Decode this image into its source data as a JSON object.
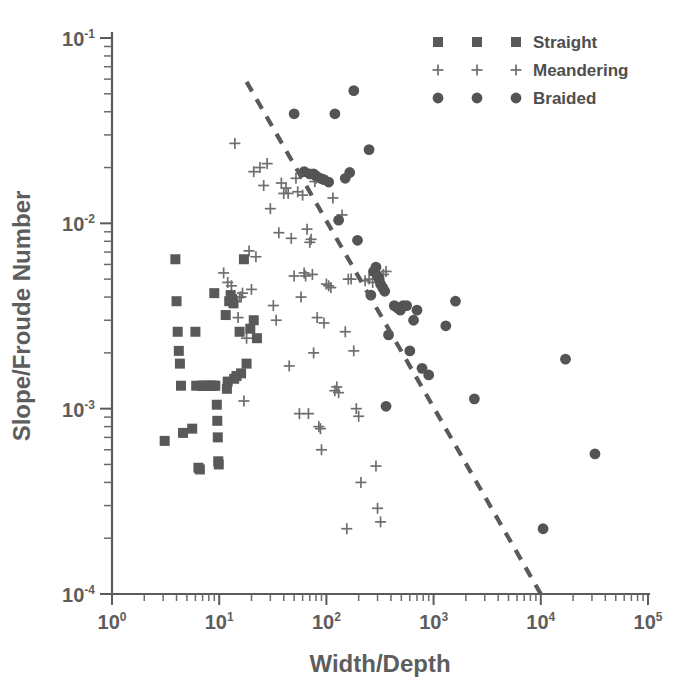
{
  "chart_data": {
    "type": "scatter",
    "title": "",
    "xlabel": "Width/Depth",
    "ylabel": "Slope/Froude Number",
    "xscale": "log",
    "yscale": "log",
    "xlim": [
      1,
      100000
    ],
    "ylim": [
      0.0001,
      0.1
    ],
    "grid": false,
    "legend_position": "top-right",
    "xtick_labels": [
      "10",
      "10",
      "10",
      "10",
      "10",
      "10"
    ],
    "xtick_exponents": [
      "0",
      "1",
      "2",
      "3",
      "4",
      "5"
    ],
    "ytick_labels": [
      "10",
      "10",
      "10",
      "10"
    ],
    "ytick_exponents": [
      "-1",
      "-2",
      "-3",
      "-4"
    ],
    "series": [
      {
        "name": "Straight",
        "marker": "square",
        "color": "#595959",
        "points": [
          [
            3.1,
            0.00067
          ],
          [
            3.9,
            0.0064
          ],
          [
            4.0,
            0.0038
          ],
          [
            4.1,
            0.0026
          ],
          [
            4.2,
            0.00205
          ],
          [
            4.3,
            0.00175
          ],
          [
            4.4,
            0.00133
          ],
          [
            4.6,
            0.00074
          ],
          [
            5.6,
            0.00078
          ],
          [
            6.0,
            0.0026
          ],
          [
            6.1,
            0.00133
          ],
          [
            6.4,
            0.00048
          ],
          [
            6.6,
            0.00047
          ],
          [
            6.9,
            0.00133
          ],
          [
            7.2,
            0.00133
          ],
          [
            7.6,
            0.00133
          ],
          [
            8.0,
            0.00133
          ],
          [
            8.4,
            0.00133
          ],
          [
            8.8,
            0.00133
          ],
          [
            9.2,
            0.00133
          ],
          [
            9.0,
            0.0042
          ],
          [
            9.5,
            0.00105
          ],
          [
            9.6,
            0.00086
          ],
          [
            9.7,
            0.0007
          ],
          [
            9.8,
            0.00052
          ],
          [
            9.9,
            0.0005
          ],
          [
            11.5,
            0.0032
          ],
          [
            11.8,
            0.00128
          ],
          [
            12.0,
            0.0014
          ],
          [
            12.4,
            0.0038
          ],
          [
            12.8,
            0.0041
          ],
          [
            13.2,
            0.0039
          ],
          [
            13.6,
            0.0037
          ],
          [
            13.8,
            0.00145
          ],
          [
            14.5,
            0.0015
          ],
          [
            15.5,
            0.0026
          ],
          [
            16.0,
            0.00155
          ],
          [
            17.0,
            0.0064
          ],
          [
            18.0,
            0.00175
          ],
          [
            19.5,
            0.0027
          ],
          [
            21.0,
            0.003
          ],
          [
            22.5,
            0.0024
          ]
        ]
      },
      {
        "name": "Meandering",
        "marker": "cross",
        "color": "#6e6e6e",
        "points": [
          [
            11.0,
            0.0054
          ],
          [
            12.0,
            0.0048
          ],
          [
            13.0,
            0.0046
          ],
          [
            14.0,
            0.027
          ],
          [
            14.5,
            0.0038
          ],
          [
            15.0,
            0.0031
          ],
          [
            15.5,
            0.004
          ],
          [
            16.0,
            0.004
          ],
          [
            16.5,
            0.0042
          ],
          [
            17.0,
            0.0011
          ],
          [
            18.0,
            0.0024
          ],
          [
            19.0,
            0.0071
          ],
          [
            20.0,
            0.0044
          ],
          [
            21.0,
            0.019
          ],
          [
            22.0,
            0.0066
          ],
          [
            24.0,
            0.02
          ],
          [
            26.0,
            0.016
          ],
          [
            28.0,
            0.021
          ],
          [
            30.0,
            0.012
          ],
          [
            32.0,
            0.0036
          ],
          [
            34.0,
            0.003
          ],
          [
            36.0,
            0.0089
          ],
          [
            38.0,
            0.0165
          ],
          [
            40.0,
            0.0145
          ],
          [
            42.0,
            0.0155
          ],
          [
            44.0,
            0.0145
          ],
          [
            45.0,
            0.0017
          ],
          [
            47.0,
            0.0083
          ],
          [
            50.0,
            0.0052
          ],
          [
            52.0,
            0.0175
          ],
          [
            54.0,
            0.0148
          ],
          [
            56.0,
            0.00094
          ],
          [
            58.0,
            0.004
          ],
          [
            60.0,
            0.0142
          ],
          [
            62.0,
            0.0054
          ],
          [
            64.0,
            0.0052
          ],
          [
            66.0,
            0.0093
          ],
          [
            68.0,
            0.00094
          ],
          [
            70.0,
            0.0079
          ],
          [
            72.0,
            0.0082
          ],
          [
            74.0,
            0.0053
          ],
          [
            76.0,
            0.002
          ],
          [
            78.0,
            0.0168
          ],
          [
            80.0,
            0.0175
          ],
          [
            82.0,
            0.0031
          ],
          [
            85.0,
            0.0008
          ],
          [
            88.0,
            0.00078
          ],
          [
            90.0,
            0.0006
          ],
          [
            95.0,
            0.0029
          ],
          [
            100.0,
            0.0047
          ],
          [
            105.0,
            0.0046
          ],
          [
            110.0,
            0.0045
          ],
          [
            115.0,
            0.0137
          ],
          [
            120.0,
            0.00125
          ],
          [
            125.0,
            0.00131
          ],
          [
            130.0,
            0.00122
          ],
          [
            140.0,
            0.0111
          ],
          [
            150.0,
            0.0026
          ],
          [
            155.0,
            0.000225
          ],
          [
            160.0,
            0.005
          ],
          [
            170.0,
            0.005
          ],
          [
            180.0,
            0.00205
          ],
          [
            190.0,
            0.001
          ],
          [
            200.0,
            0.00091
          ],
          [
            210.0,
            0.0004
          ],
          [
            230.0,
            0.0049
          ],
          [
            250.0,
            0.005
          ],
          [
            270.0,
            0.0048
          ],
          [
            290.0,
            0.00049
          ],
          [
            300.0,
            0.00029
          ],
          [
            320.0,
            0.000245
          ],
          [
            340.0,
            0.0053
          ],
          [
            360.0,
            0.0055
          ]
        ]
      },
      {
        "name": "Braided",
        "marker": "circle",
        "color": "#545454",
        "points": [
          [
            50.0,
            0.039
          ],
          [
            62.0,
            0.019
          ],
          [
            70.0,
            0.0185
          ],
          [
            76.0,
            0.0185
          ],
          [
            80.0,
            0.018
          ],
          [
            88.0,
            0.0175
          ],
          [
            95.0,
            0.0172
          ],
          [
            105.0,
            0.0167
          ],
          [
            120.0,
            0.039
          ],
          [
            130.0,
            0.0104
          ],
          [
            150.0,
            0.0175
          ],
          [
            165.0,
            0.0188
          ],
          [
            180.0,
            0.052
          ],
          [
            195.0,
            0.0081
          ],
          [
            250.0,
            0.025
          ],
          [
            260.0,
            0.0041
          ],
          [
            275.0,
            0.0055
          ],
          [
            290.0,
            0.0058
          ],
          [
            300.0,
            0.0052
          ],
          [
            310.0,
            0.005
          ],
          [
            320.0,
            0.0047
          ],
          [
            335.0,
            0.0045
          ],
          [
            350.0,
            0.0043
          ],
          [
            360.0,
            0.00103
          ],
          [
            380.0,
            0.0025
          ],
          [
            430.0,
            0.0036
          ],
          [
            460.0,
            0.0035
          ],
          [
            490.0,
            0.0034
          ],
          [
            520.0,
            0.0036
          ],
          [
            560.0,
            0.0036
          ],
          [
            600.0,
            0.00205
          ],
          [
            650.0,
            0.003
          ],
          [
            700.0,
            0.0034
          ],
          [
            780.0,
            0.00165
          ],
          [
            900.0,
            0.00152
          ],
          [
            1300.0,
            0.0028
          ],
          [
            1600.0,
            0.0038
          ],
          [
            2400.0,
            0.00113
          ],
          [
            10500.0,
            0.000225
          ],
          [
            17000.0,
            0.00185
          ],
          [
            32000.0,
            0.00057
          ]
        ]
      }
    ],
    "trendline": {
      "style": "dashed",
      "color": "#5a5a5a",
      "x_start": 18.0,
      "y_start": 0.058,
      "x_end": 10000.0,
      "y_end": 0.0001
    }
  },
  "legend": {
    "entries": [
      {
        "label": "Straight",
        "marker": "square"
      },
      {
        "label": "Meandering",
        "marker": "cross"
      },
      {
        "label": "Braided",
        "marker": "circle"
      }
    ]
  }
}
